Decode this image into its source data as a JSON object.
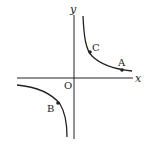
{
  "diagram": {
    "type": "hyperbola-graph",
    "axes": {
      "x_label": "x",
      "y_label": "y",
      "origin_label": "O"
    },
    "points": [
      {
        "name": "A",
        "label": "A"
      },
      {
        "name": "B",
        "label": "B"
      },
      {
        "name": "C",
        "label": "C"
      }
    ],
    "colors": {
      "stroke": "#222222",
      "background": "#ffffff"
    }
  }
}
